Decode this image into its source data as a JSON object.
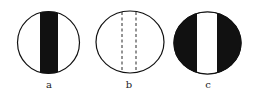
{
  "figure": {
    "panels": [
      {
        "label": "a",
        "style": "white circle with central black vertical band"
      },
      {
        "label": "b",
        "style": "white circle with two dashed vertical lines"
      },
      {
        "label": "c",
        "style": "black circle with central white vertical band"
      }
    ],
    "colors": {
      "ink": "#111111",
      "paper": "#ffffff"
    }
  }
}
